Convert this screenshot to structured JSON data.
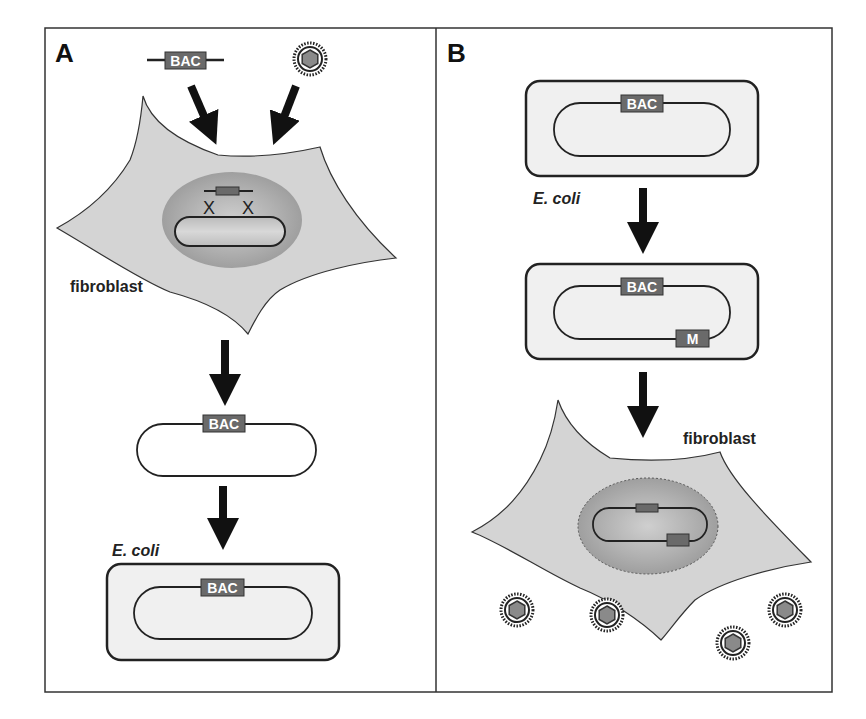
{
  "figure": {
    "panels": [
      {
        "id": "A",
        "label": "A"
      },
      {
        "id": "B",
        "label": "B"
      }
    ],
    "colors": {
      "frame": "#333333",
      "cell_fill": "#d4d4d4",
      "nucleus_fill": "#a9a9a9",
      "ecoli_fill": "#f0f0f0",
      "marker_fill": "#6a6a6a",
      "arrow": "#111111"
    }
  },
  "panel_a": {
    "input_bac_label": "BAC",
    "input_virus": "virion-icon",
    "cell_label": "fibroblast",
    "nucleus_content": "homologous-recombination (BAC cassette × viral genome)",
    "circular_bac_label": "BAC",
    "ecoli_label": "E. coli",
    "ecoli_bac_label": "BAC"
  },
  "panel_b": {
    "ecoli1_bac_label": "BAC",
    "ecoli_label": "E. coli",
    "ecoli2_bac_label": "BAC",
    "ecoli2_mutation_label": "M",
    "cell_label": "fibroblast",
    "progeny_virus_count": 4
  }
}
